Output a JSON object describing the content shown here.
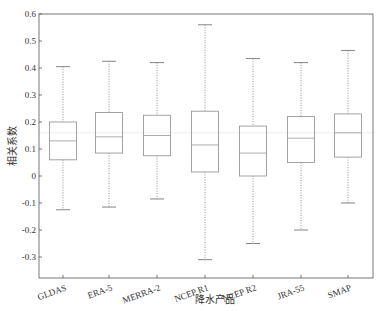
{
  "chart_data": {
    "type": "box",
    "title": "",
    "xlabel": "降水产品",
    "ylabel": "相关系数",
    "ylim": [
      -0.35,
      0.6
    ],
    "yticks": [
      0.6,
      0.5,
      0.4,
      0.3,
      0.2,
      0.1,
      0,
      -0.1,
      -0.2,
      -0.3
    ],
    "ytick_labels": [
      "0.6",
      "0.5",
      "0.4",
      "0.3",
      "0.2",
      "0.1",
      "0",
      "-0.1",
      "-0.2",
      "-0.3"
    ],
    "grid": false,
    "legend": null,
    "reference_line": 0.16,
    "categories": [
      "GLDAS",
      "ERA-5",
      "MERRA-2",
      "NCEP R1",
      "NCEP R2",
      "JRA-55",
      "SMAP"
    ],
    "series": [
      {
        "name": "GLDAS",
        "whisker_high": 0.405,
        "q3": 0.2,
        "median": 0.13,
        "q1": 0.06,
        "whisker_low": -0.125
      },
      {
        "name": "ERA-5",
        "whisker_high": 0.425,
        "q3": 0.235,
        "median": 0.145,
        "q1": 0.085,
        "whisker_low": -0.115
      },
      {
        "name": "MERRA-2",
        "whisker_high": 0.42,
        "q3": 0.225,
        "median": 0.15,
        "q1": 0.075,
        "whisker_low": -0.085
      },
      {
        "name": "NCEP R1",
        "whisker_high": 0.56,
        "q3": 0.24,
        "median": 0.115,
        "q1": 0.015,
        "whisker_low": -0.31
      },
      {
        "name": "NCEP R2",
        "whisker_high": 0.435,
        "q3": 0.185,
        "median": 0.085,
        "q1": 0.0,
        "whisker_low": -0.25
      },
      {
        "name": "JRA-55",
        "whisker_high": 0.42,
        "q3": 0.22,
        "median": 0.14,
        "q1": 0.05,
        "whisker_low": -0.2
      },
      {
        "name": "SMAP",
        "whisker_high": 0.465,
        "q3": 0.23,
        "median": 0.16,
        "q1": 0.07,
        "whisker_low": -0.1
      }
    ],
    "colors": {
      "axis": "#555555",
      "box": "#999999",
      "whisker": "#777777",
      "reference_line": "#eeeeee",
      "text": "#333333"
    }
  }
}
